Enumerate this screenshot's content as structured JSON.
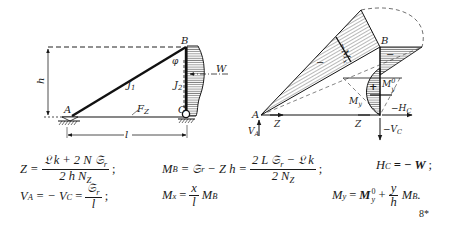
{
  "figure": {
    "left_diagram": {
      "title": "Dreigelenk-Dreiecksrahmen",
      "nodes": [
        {
          "id": "A",
          "label": "A"
        },
        {
          "id": "B",
          "label": "B"
        },
        {
          "id": "C",
          "label": "C"
        }
      ],
      "members": [
        {
          "id": "diagonal",
          "label": "J",
          "sub": "1"
        },
        {
          "id": "vertical",
          "label": "J",
          "sub": "2"
        },
        {
          "id": "tie",
          "label": "F",
          "sub": "Z"
        }
      ],
      "dimensions": {
        "height": "h",
        "span": "l"
      },
      "load": {
        "label": "W"
      },
      "angle_label": "φ"
    },
    "right_diagram": {
      "nodes": [
        {
          "id": "A",
          "label": "A"
        },
        {
          "id": "B",
          "label": "B"
        }
      ],
      "sign_minus": "−",
      "sign_plus": "+",
      "moment_label_diag": "−M",
      "moment_label_diag_sub": "x",
      "moment_label_vert": "M",
      "moment_label_vert_sup": "0",
      "moment_label_vert_sub": "y",
      "moment_label_My": "M",
      "moment_label_My_sub": "y",
      "forces": {
        "Z_left": "Z",
        "Z_right": "Z",
        "VA": "V",
        "VA_sub": "A",
        "HC": "−H",
        "HC_sub": "C",
        "VC": "−V",
        "VC_sub": "C"
      }
    }
  },
  "formulas": {
    "eq1": {
      "lhs": "Z =",
      "num": "𝔏 k + 2 N 𝔖",
      "num_sub": "r",
      "den": "2 h N",
      "den_sub": "Z",
      "end": ";"
    },
    "eq2": {
      "lhs": "M",
      "lhs_sub": "B",
      "mid": "= 𝔖",
      "mid_sub": "r",
      "mid2": "− Z h =",
      "num": "2 L 𝔖",
      "num_sub": "r",
      "num2": "− 𝔏 k",
      "den": "2 N",
      "den_sub": "Z",
      "end": ";"
    },
    "eq3": {
      "lhs": "H",
      "lhs_sub": "C",
      "rhs": "= − W",
      "end": ";"
    },
    "eq4": {
      "lhs": "V",
      "lhs_sub": "A",
      "mid": "= − V",
      "mid_sub": "C",
      "eq": "=",
      "num": "𝔖",
      "num_sub": "r",
      "den": "l",
      "end": ";"
    },
    "eq5": {
      "lhs": "M",
      "lhs_sub": "x",
      "eq": "=",
      "num": "x",
      "den": "l",
      "rhs": "M",
      "rhs_sub": "B"
    },
    "eq6": {
      "lhs": "M",
      "lhs_sub": "y",
      "eq": "=",
      "m0": "M",
      "m0_sup": "0",
      "m0_sub": "y",
      "plus": "+",
      "num": "y",
      "den": "h",
      "rhs": "M",
      "rhs_sub": "B",
      "end": "."
    }
  },
  "page_number": "8*"
}
